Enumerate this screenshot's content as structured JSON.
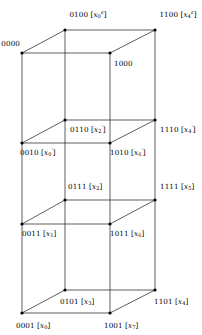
{
  "figure": {
    "name": "4-dimensional hypercube vertex labeling diagram",
    "width": 202,
    "height": 335,
    "background": "#ffffff",
    "line_color": "#1a1a1a",
    "text_color": "#000000"
  },
  "chart_data": {
    "type": "diagram",
    "title": "",
    "vertices": [
      {
        "id": "0100",
        "code": "0100",
        "var": "x",
        "sub": "0",
        "sup": "ε",
        "label": "0100 [x₀^ε]",
        "x": 65,
        "y": 30,
        "anchor": "center",
        "label_x": 88,
        "label_y": 15
      },
      {
        "id": "1100",
        "code": "1100",
        "var": "x",
        "sub": "4",
        "sup": "ε",
        "label": "1100 [x₄^ε]",
        "x": 155,
        "y": 30,
        "anchor": "center",
        "label_x": 178,
        "label_y": 15
      },
      {
        "id": "0000",
        "code": "0000",
        "var": "",
        "sub": "",
        "sup": "",
        "label": "0000",
        "x": 22,
        "y": 53,
        "anchor": "right",
        "label_x": 20,
        "label_y": 44
      },
      {
        "id": "1000",
        "code": "1000",
        "var": "",
        "sub": "",
        "sup": "",
        "label": "1000",
        "x": 110,
        "y": 53,
        "anchor": "left",
        "label_x": 114,
        "label_y": 64
      },
      {
        "id": "0110",
        "code": "0110",
        "var": "x",
        "sub": "2",
        "sup": "′",
        "label": "0110 [x₂′]",
        "x": 65,
        "y": 120,
        "anchor": "left",
        "label_x": 70,
        "label_y": 130
      },
      {
        "id": "1110",
        "code": "1110",
        "var": "x",
        "sub": "4",
        "sup": "′",
        "label": "1110 [x₄′]",
        "x": 155,
        "y": 120,
        "anchor": "left",
        "label_x": 160,
        "label_y": 130
      },
      {
        "id": "0010",
        "code": "0010",
        "var": "x",
        "sub": "0",
        "sup": "′",
        "label": "0010 [x₀′]",
        "x": 22,
        "y": 143,
        "anchor": "left",
        "label_x": 20,
        "label_y": 153
      },
      {
        "id": "1010",
        "code": "1010",
        "var": "x",
        "sub": "6",
        "sup": "′",
        "label": "1010 [x₆′]",
        "x": 110,
        "y": 143,
        "anchor": "left",
        "label_x": 110,
        "label_y": 153
      },
      {
        "id": "0111",
        "code": "0111",
        "var": "x",
        "sub": "2",
        "sup": "",
        "label": "0111 [x₂]",
        "x": 65,
        "y": 200,
        "anchor": "left",
        "label_x": 68,
        "label_y": 187
      },
      {
        "id": "1111",
        "code": "1111",
        "var": "x",
        "sub": "5",
        "sup": "",
        "label": "1111 [x₅]",
        "x": 155,
        "y": 200,
        "anchor": "left",
        "label_x": 160,
        "label_y": 187
      },
      {
        "id": "0011",
        "code": "0011",
        "var": "x",
        "sub": "1",
        "sup": "",
        "label": "0011 [x₁]",
        "x": 22,
        "y": 224,
        "anchor": "left",
        "label_x": 22,
        "label_y": 234
      },
      {
        "id": "1011",
        "code": "1011",
        "var": "x",
        "sub": "6",
        "sup": "",
        "label": "1011 [x₆]",
        "x": 110,
        "y": 224,
        "anchor": "left",
        "label_x": 110,
        "label_y": 234
      },
      {
        "id": "0101",
        "code": "0101",
        "var": "x",
        "sub": "3",
        "sup": "",
        "label": "0101 [x₃]",
        "x": 65,
        "y": 290,
        "anchor": "left",
        "label_x": 60,
        "label_y": 302
      },
      {
        "id": "1101",
        "code": "1101",
        "var": "x",
        "sub": "4",
        "sup": "",
        "label": "1101 [x₄]",
        "x": 155,
        "y": 290,
        "anchor": "left",
        "label_x": 154,
        "label_y": 302
      },
      {
        "id": "0001",
        "code": "0001",
        "var": "x",
        "sub": "0",
        "sup": "",
        "label": "0001 [x₀]",
        "x": 22,
        "y": 313,
        "anchor": "left",
        "label_x": 16,
        "label_y": 326
      },
      {
        "id": "1001",
        "code": "1001",
        "var": "x",
        "sub": "7",
        "sup": "",
        "label": "1001 [x₇]",
        "x": 110,
        "y": 313,
        "anchor": "left",
        "label_x": 104,
        "label_y": 326
      }
    ],
    "levels": [
      {
        "name": "level-top",
        "quad": [
          "0000",
          "0100",
          "1100",
          "1000"
        ]
      },
      {
        "name": "level-upper-mid",
        "quad": [
          "0010",
          "0110",
          "1110",
          "1010"
        ]
      },
      {
        "name": "level-lower-mid",
        "quad": [
          "0011",
          "0111",
          "1111",
          "1011"
        ]
      },
      {
        "name": "level-bottom",
        "quad": [
          "0001",
          "0101",
          "1101",
          "1001"
        ]
      }
    ],
    "vertical_columns": [
      [
        "0000",
        "0010",
        "0011",
        "0001"
      ],
      [
        "0100",
        "0110",
        "0111",
        "0101"
      ],
      [
        "1000",
        "1010",
        "1011",
        "1001"
      ],
      [
        "1100",
        "1110",
        "1111",
        "1101"
      ]
    ]
  }
}
